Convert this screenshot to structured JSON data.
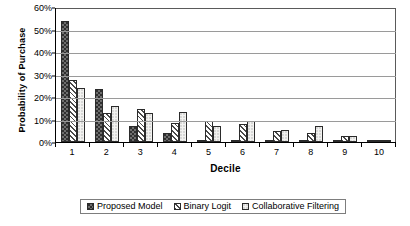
{
  "chart_data": {
    "type": "bar",
    "title": "",
    "xlabel": "Decile",
    "ylabel": "Probability of Purchase",
    "categories": [
      "1",
      "2",
      "3",
      "4",
      "5",
      "6",
      "7",
      "8",
      "9",
      "10"
    ],
    "ylim": [
      0,
      60
    ],
    "ytick_labels": [
      "0%",
      "10%",
      "20%",
      "30%",
      "40%",
      "50%",
      "60%"
    ],
    "ytick_values": [
      0,
      10,
      20,
      30,
      40,
      50,
      60
    ],
    "grid": true,
    "legend_position": "bottom",
    "series": [
      {
        "name": "Proposed Model",
        "fill": "dark-stipple",
        "color": "#6e6e6e",
        "values": [
          54,
          23.5,
          7,
          4,
          0.5,
          0.5,
          0.3,
          0.3,
          0.2,
          0.5
        ]
      },
      {
        "name": "Binary Logit",
        "fill": "diagonal-hatch",
        "color": "#4a4a4a",
        "values": [
          27.5,
          13,
          14.5,
          8.5,
          9.5,
          8,
          5,
          4,
          2.5,
          0.8
        ]
      },
      {
        "name": "Collaborative Filtering",
        "fill": "light-stipple",
        "color": "#f2f2f0",
        "values": [
          24,
          16,
          13,
          13.5,
          7,
          9.5,
          5.5,
          7,
          2.5,
          0.8
        ]
      }
    ]
  }
}
